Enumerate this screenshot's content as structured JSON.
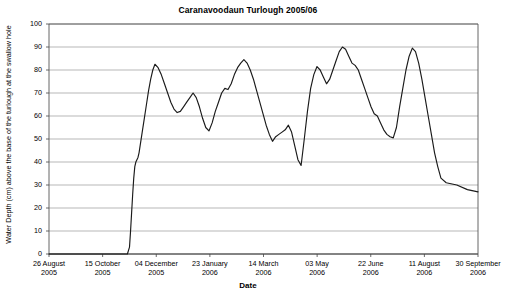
{
  "chart_data": {
    "type": "line",
    "title": "Caranavoodaun Turlough 2005/06",
    "xlabel": "Date",
    "ylabel": "Water Depth (cm) above the base of the turlough at the swallow hole",
    "ylim": [
      0,
      100
    ],
    "ytick_values": [
      0,
      10,
      20,
      30,
      40,
      50,
      60,
      70,
      80,
      90,
      100
    ],
    "ytick_labels": [
      "0",
      "10",
      "20",
      "30",
      "40",
      "50",
      "60",
      "70",
      "80",
      "90",
      "100"
    ],
    "grid": "horizontal",
    "legend": "none",
    "line_color": "#1a1a1a",
    "xtick_labels": [
      {
        "line1": "26 August",
        "line2": "2005"
      },
      {
        "line1": "15 October",
        "line2": "2005"
      },
      {
        "line1": "04 December",
        "line2": "2005"
      },
      {
        "line1": "23 January",
        "line2": "2006"
      },
      {
        "line1": "14 March",
        "line2": "2006"
      },
      {
        "line1": "03 May",
        "line2": "2006"
      },
      {
        "line1": "22 June",
        "line2": "2006"
      },
      {
        "line1": "11 August",
        "line2": "2006"
      },
      {
        "line1": "30 September",
        "line2": "2006"
      }
    ],
    "x_axis_start_date": "26 August 2005",
    "x_axis_end_date": "30 September 2006",
    "x_tick_interval_days": 49,
    "series": [
      {
        "name": "Water Depth",
        "x_days_from_start": [
          0,
          8,
          16,
          24,
          32,
          40,
          48,
          56,
          64,
          70,
          74,
          76,
          77,
          78,
          79,
          80,
          81,
          82,
          83,
          84,
          85,
          86,
          88,
          90,
          92,
          94,
          96,
          98,
          100,
          103,
          106,
          109,
          112,
          115,
          118,
          121,
          124,
          127,
          130,
          133,
          136,
          139,
          142,
          145,
          148,
          151,
          154,
          157,
          160,
          163,
          166,
          169,
          172,
          175,
          178,
          181,
          184,
          187,
          190,
          193,
          196,
          199,
          202,
          205,
          208,
          211,
          214,
          217,
          220,
          223,
          226,
          229,
          232,
          235,
          238,
          241,
          244,
          247,
          250,
          253,
          256,
          259,
          262,
          265,
          268,
          271,
          274,
          277,
          280,
          283,
          286,
          289,
          292,
          295,
          298,
          301,
          304,
          307,
          310,
          313,
          316,
          319,
          322,
          325,
          328,
          331,
          334,
          337,
          340,
          343,
          346,
          349,
          352,
          355,
          358,
          361,
          364,
          367,
          370,
          375,
          385,
          395,
          405
        ],
        "values": [
          0,
          0,
          0,
          0,
          0,
          0,
          0,
          0,
          0,
          0,
          0,
          3,
          10,
          18,
          26,
          33,
          38,
          40,
          41,
          42,
          44,
          47,
          53,
          59,
          65,
          71,
          76,
          80,
          82.5,
          81,
          78,
          74,
          70,
          66,
          63,
          61.5,
          62,
          64,
          66,
          68,
          70,
          68,
          64,
          59,
          55,
          53.5,
          57,
          62,
          66,
          70,
          72,
          71.5,
          74,
          78,
          81,
          83,
          84.5,
          83,
          80,
          76,
          71,
          66,
          61,
          56,
          52,
          49,
          51,
          52,
          53,
          54,
          56,
          53,
          47,
          41,
          38.5,
          50,
          62,
          72,
          78,
          81.5,
          80,
          77,
          74,
          76,
          80,
          84,
          88,
          90,
          89,
          86,
          83,
          82,
          80,
          76,
          72,
          68,
          64,
          61,
          60,
          57,
          54,
          52,
          51,
          50.5,
          55,
          64,
          72,
          80,
          86,
          89.5,
          88,
          83,
          76,
          68,
          60,
          52,
          44,
          38,
          33,
          31,
          30,
          28,
          27,
          26,
          22,
          14,
          5,
          0
        ]
      }
    ],
    "notes": {
      "peak_max_cm": 90,
      "number_of_major_peaks": 5,
      "dry_period_start": "26 August 2005",
      "dry_period_end_approx": "11 August 2006"
    }
  },
  "axes": {
    "plot_left_px": 49,
    "plot_right_px": 478,
    "plot_top_px": 24,
    "plot_bottom_px": 254
  }
}
